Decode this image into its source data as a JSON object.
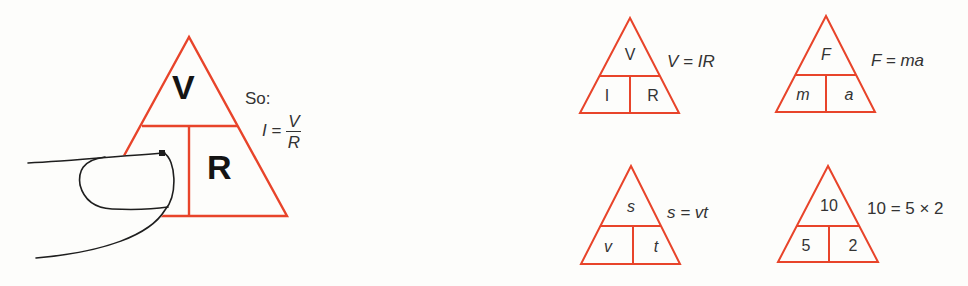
{
  "colors": {
    "triangle_stroke": "#e8442a",
    "finger_stroke": "#1e1e1e",
    "text": "#333333",
    "background": "#fdfdfb"
  },
  "main_triangle": {
    "top": "V",
    "bottom_left": "I",
    "bottom_right": "R",
    "note": "So:",
    "derived_formula": {
      "lhs": "I",
      "equals": "=",
      "numerator": "V",
      "denominator": "R"
    },
    "covering_object": "finger-covering-I"
  },
  "examples": [
    {
      "top": "V",
      "bottom_left": "I",
      "bottom_right": "R",
      "formula": "V = IR",
      "italic_cells": false
    },
    {
      "top": "F",
      "bottom_left": "m",
      "bottom_right": "a",
      "formula": "F = ma",
      "italic_cells": true
    },
    {
      "top": "s",
      "bottom_left": "v",
      "bottom_right": "t",
      "formula": "s = vt",
      "italic_cells": true
    },
    {
      "top": "10",
      "bottom_left": "5",
      "bottom_right": "2",
      "formula": "10 = 5 × 2",
      "italic_cells": false
    }
  ]
}
